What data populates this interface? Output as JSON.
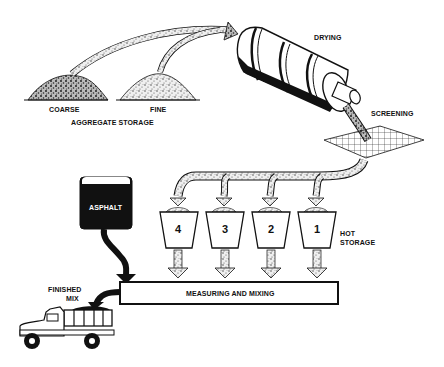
{
  "diagram": {
    "stages": {
      "aggregate_storage": {
        "label": "AGGREGATE STORAGE",
        "piles": [
          {
            "label": "COARSE"
          },
          {
            "label": "FINE"
          }
        ]
      },
      "drying": {
        "label": "DRYING"
      },
      "screening": {
        "label": "SCREENING"
      },
      "hot_storage": {
        "label_line1": "HOT",
        "label_line2": "STORAGE",
        "bins": [
          {
            "label": "4"
          },
          {
            "label": "3"
          },
          {
            "label": "2"
          },
          {
            "label": "1"
          }
        ]
      },
      "asphalt": {
        "label": "ASPHALT"
      },
      "measuring_mixing": {
        "label": "MEASURING AND MIXING"
      },
      "finished_mix": {
        "label_line1": "FINISHED",
        "label_line2": "MIX"
      }
    },
    "flow": [
      "aggregate_storage -> drying",
      "drying -> screening",
      "screening -> hot_storage",
      "hot_storage -> measuring_mixing",
      "asphalt -> measuring_mixing",
      "measuring_mixing -> finished_mix"
    ],
    "colors": {
      "ink": "#111111",
      "paper": "#ffffff",
      "aggregate_fill": "#d8d8d8"
    }
  }
}
